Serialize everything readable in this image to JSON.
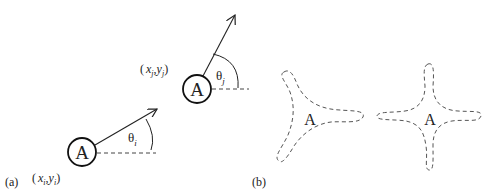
{
  "panel_a": {
    "label": "(a)",
    "agent_i": {
      "glyph": "A",
      "position_label": {
        "open": "(",
        "x": "x",
        "x_sub": "i",
        "comma": ",",
        "y": "y",
        "y_sub": "i",
        "close": ")"
      },
      "angle_label": {
        "symbol": "θ",
        "sub": "i"
      }
    },
    "agent_j": {
      "glyph": "A",
      "position_label": {
        "open": "(",
        "x": "x",
        "x_sub": "j",
        "comma": ",",
        "y": "y",
        "y_sub": "j",
        "close": ")"
      },
      "angle_label": {
        "symbol": "θ",
        "sub": "j"
      }
    }
  },
  "panel_b": {
    "label": "(b)",
    "shapes": [
      {
        "name": "three-armed-star",
        "glyph": "A"
      },
      {
        "name": "four-armed-star",
        "glyph": "A"
      }
    ]
  },
  "colors": {
    "stroke": "#222222",
    "dashed": "#444444",
    "text": "#222222"
  }
}
